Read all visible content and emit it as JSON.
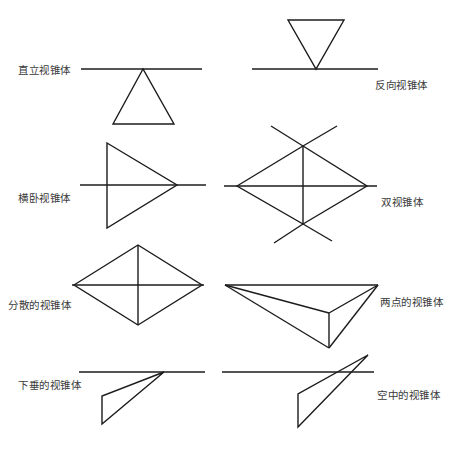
{
  "diagrams": [
    {
      "id": "upright",
      "label": "直立视锥体",
      "label_pos": [
        18,
        64
      ],
      "lines": [
        [
          81,
          69,
          202,
          69
        ]
      ],
      "polygons": [
        [
          [
            143,
            69
          ],
          [
            113,
            124
          ],
          [
            174,
            124
          ]
        ]
      ]
    },
    {
      "id": "inverted",
      "label": "反向视锥体",
      "label_pos": [
        375,
        79
      ],
      "lines": [
        [
          252,
          69,
          378,
          69
        ]
      ],
      "polygons": [
        [
          [
            288,
            20
          ],
          [
            344,
            20
          ],
          [
            316,
            69
          ]
        ]
      ]
    },
    {
      "id": "lying",
      "label": "横卧视锥体",
      "label_pos": [
        18,
        192
      ],
      "lines": [
        [
          80,
          185,
          206,
          185
        ]
      ],
      "polygons": [
        [
          [
            107,
            143
          ],
          [
            177,
            185
          ],
          [
            107,
            228
          ]
        ]
      ]
    },
    {
      "id": "double",
      "label": "双视锥体",
      "label_pos": [
        381,
        196
      ],
      "lines": [
        [
          224,
          186,
          377,
          186
        ],
        [
          303,
          146,
          303,
          224
        ],
        [
          271,
          126,
          303,
          146
        ],
        [
          337,
          126,
          303,
          146
        ],
        [
          303,
          224,
          274,
          243
        ],
        [
          303,
          224,
          332,
          241
        ]
      ],
      "polygons": [
        [
          [
            237,
            186
          ],
          [
            303,
            146
          ],
          [
            367,
            186
          ],
          [
            303,
            224
          ]
        ]
      ]
    },
    {
      "id": "scattered",
      "label": "分散的视锥体",
      "label_pos": [
        8,
        299
      ],
      "lines": [
        [
          72,
          285,
          204,
          285
        ],
        [
          138,
          245,
          138,
          325
        ]
      ],
      "polygons": [
        [
          [
            74,
            285
          ],
          [
            138,
            245
          ],
          [
            202,
            285
          ],
          [
            138,
            325
          ]
        ]
      ]
    },
    {
      "id": "two-point",
      "label": "两点的视锥体",
      "label_pos": [
        380,
        296
      ],
      "lines": [
        [
          225,
          285,
          378,
          285
        ],
        [
          225,
          285,
          329,
          313
        ],
        [
          225,
          285,
          329,
          348
        ],
        [
          329,
          313,
          329,
          348
        ],
        [
          378,
          285,
          329,
          313
        ],
        [
          378,
          285,
          329,
          348
        ]
      ],
      "polygons": []
    },
    {
      "id": "drooping",
      "label": "下垂的视锥体",
      "label_pos": [
        18,
        379
      ],
      "lines": [
        [
          79,
          372,
          205,
          372
        ]
      ],
      "polygons": [
        [
          [
            164,
            372
          ],
          [
            102,
            396
          ],
          [
            102,
            424
          ]
        ]
      ]
    },
    {
      "id": "aerial",
      "label": "空中的视锥体",
      "label_pos": [
        377,
        389
      ],
      "lines": [
        [
          222,
          372,
          374,
          372
        ]
      ],
      "polygons": [
        [
          [
            368,
            355
          ],
          [
            298,
            394
          ],
          [
            298,
            427
          ]
        ]
      ]
    }
  ],
  "style": {
    "stroke_color": "#1c1c1c",
    "label_color": "#3a3a3a",
    "background": "#ffffff"
  }
}
